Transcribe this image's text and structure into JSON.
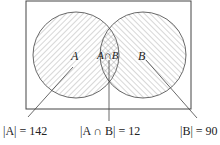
{
  "diagram": {
    "type": "venn",
    "sets": [
      {
        "name": "A",
        "label": "A",
        "cardinality_label": "|A| = 142",
        "size": 142
      },
      {
        "name": "B",
        "label": "B",
        "cardinality_label": "|B| = 90",
        "size": 90
      }
    ],
    "intersection": {
      "label": "A∩B",
      "cardinality_label": "|A ∩ B| = 12",
      "size": 12
    },
    "colors": {
      "outline": "#444444",
      "hatch": "#9a9a9a",
      "background": "#ffffff"
    }
  },
  "labels": {
    "a": "A",
    "b": "B",
    "ab": "A∩B",
    "a_count": "|A| = 142",
    "ab_count": "|A ∩ B| = 12",
    "b_count": "|B| = 90"
  }
}
